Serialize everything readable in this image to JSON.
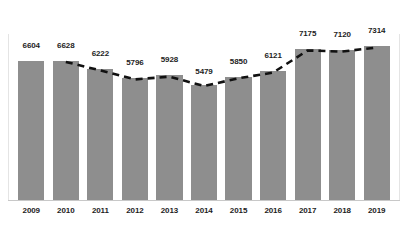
{
  "chart_data": {
    "type": "bar",
    "title": "",
    "subtitle": "",
    "xlabel": "",
    "ylabel": "",
    "grid": false,
    "legend": "none",
    "categories": [
      "2009",
      "2010",
      "2011",
      "2012",
      "2013",
      "2014",
      "2015",
      "2016",
      "2017",
      "2018",
      "2019"
    ],
    "values": [
      6604,
      6628,
      6222,
      5796,
      5928,
      5479,
      5850,
      6121,
      7175,
      7120,
      7314
    ],
    "value_labels": [
      "6604",
      "6628",
      "6222",
      "5796",
      "5928",
      "5479",
      "5850",
      "6121",
      "7175",
      "7120",
      "7314"
    ],
    "ylim": [
      0,
      7900
    ],
    "series": [
      {
        "name": "values",
        "type": "bar",
        "color": "#8e8e8e",
        "values": [
          6604,
          6628,
          6222,
          5796,
          5928,
          5479,
          5850,
          6121,
          7175,
          7120,
          7314
        ]
      },
      {
        "name": "trend",
        "type": "line",
        "style": "dashed",
        "color": "#111111",
        "starts_at_category": "2010",
        "ends_at_category": "2019",
        "values": [
          null,
          6628,
          6222,
          5796,
          5928,
          5479,
          5850,
          6121,
          7175,
          7120,
          7314
        ]
      }
    ],
    "colors": {
      "bar": "#8e8e8e",
      "trend_line": "#111111",
      "label_text": "#1d1d1d",
      "axis": "#c8c8c8",
      "background": "#ffffff"
    }
  }
}
